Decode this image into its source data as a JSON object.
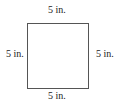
{
  "figure": {
    "shape": "square",
    "labels": {
      "top": "5 in.",
      "bottom": "5 in.",
      "left": "5 in.",
      "right": "5 in."
    }
  }
}
